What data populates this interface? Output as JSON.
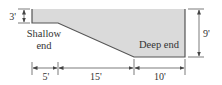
{
  "diagram": {
    "colors": {
      "pool_fill": "#dadada",
      "pool_outline": "#555555",
      "dimension_line": "#444444",
      "text": "#333333"
    },
    "labels": {
      "shallow_line1": "Shallow",
      "shallow_line2": "end",
      "deep": "Deep end"
    },
    "dimensions": {
      "shallow_depth": "3'",
      "deep_depth": "9'",
      "shallow_length": "5'",
      "slope_length": "15'",
      "deep_length": "10'"
    }
  }
}
